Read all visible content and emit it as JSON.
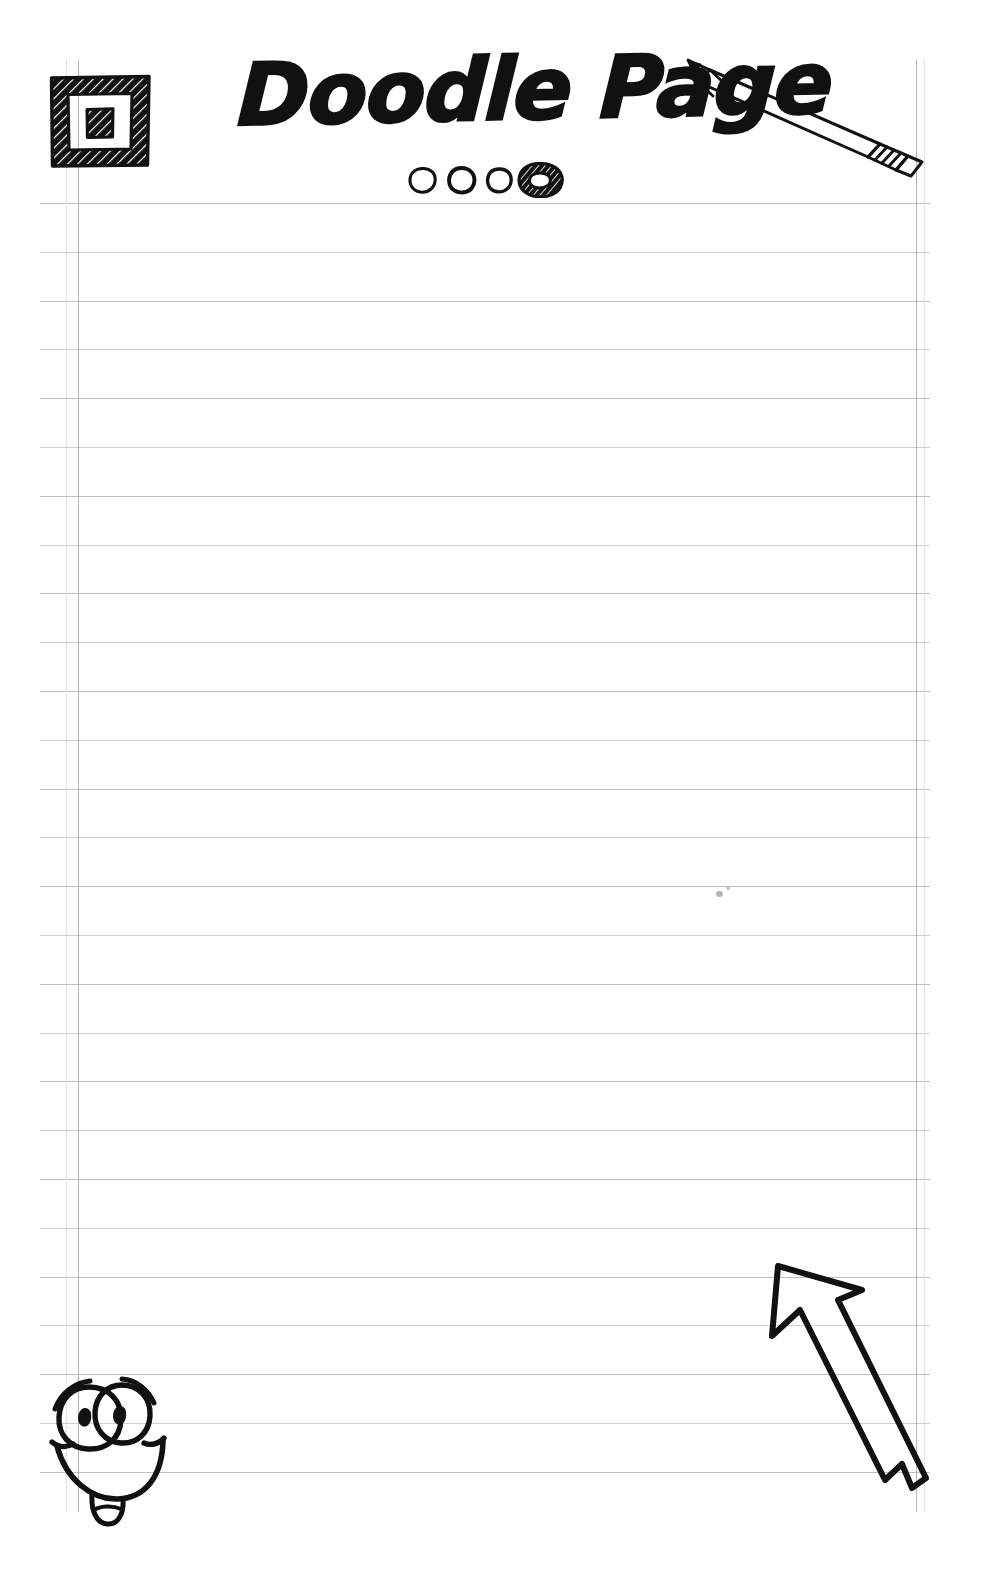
{
  "page": {
    "title": "Doodle Page",
    "width": 989,
    "height": 1595,
    "background_color": "#ffffff",
    "ink_color": "#111111",
    "rule_color": "#b9bcc0",
    "margin_color": "#b0b3b7"
  },
  "header": {
    "title_text": "Doodle Page",
    "logo": {
      "name": "nested-square-logo",
      "description": "hand-drawn hatched nested square"
    },
    "pencil": {
      "name": "pencil-doodle",
      "description": "hand-drawn pencil pointing up-left"
    },
    "dots": [
      {
        "label": "circle-1",
        "style": "outline"
      },
      {
        "label": "circle-2",
        "style": "outline"
      },
      {
        "label": "circle-3",
        "style": "outline"
      },
      {
        "label": "circle-4",
        "style": "hatched-ring"
      }
    ]
  },
  "doodles": {
    "smiley": {
      "name": "smiley-face-doodle",
      "description": "cartoon face with two big eyes, eyebrows, wide smile and tongue"
    },
    "arrow": {
      "name": "arrow-doodle",
      "description": "outlined arrow pointing up-left with notched tail"
    },
    "speck": {
      "name": "stray-pencil-speck",
      "description": "tiny stray mark on the page"
    }
  },
  "ruled_paper": {
    "first_line_y": 203,
    "line_spacing": 48.8,
    "line_count": 27,
    "line_left": 40,
    "line_right": 930,
    "margin_lines": [
      {
        "name": "left-margin-dotted",
        "x": 66,
        "style": "dotted"
      },
      {
        "name": "left-margin-solid",
        "x": 78,
        "style": "solid"
      },
      {
        "name": "right-margin-solid",
        "x": 916,
        "style": "solid"
      },
      {
        "name": "right-margin-dotted",
        "x": 924,
        "style": "dotted"
      }
    ],
    "margin_top": 60,
    "margin_bottom": 1512
  },
  "writing_area": {
    "name": "note-writing-area",
    "placeholder": ""
  }
}
